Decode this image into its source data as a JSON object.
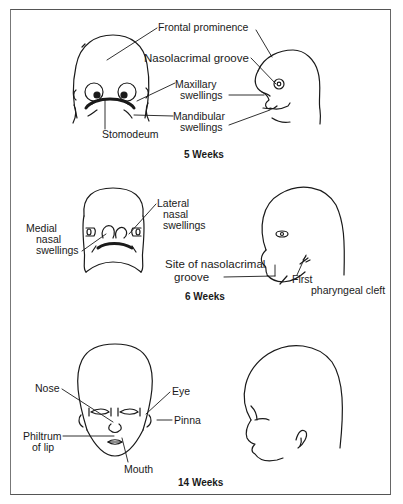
{
  "figure": {
    "panels": [
      {
        "caption": "5 Weeks",
        "labels": {
          "frontal_prominence": "Frontal prominence",
          "nasolacrimal_groove": "Nasolacrimal groove",
          "maxillary_1": "Maxillary",
          "maxillary_2": "swellings",
          "mandibular_1": "Mandibular",
          "mandibular_2": "swellings",
          "stomodeum": "Stomodeum"
        }
      },
      {
        "caption": "6 Weeks",
        "labels": {
          "lateral_1": "Lateral",
          "lateral_2": "nasal",
          "lateral_3": "swellings",
          "medial_1": "Medial",
          "medial_2": "nasal",
          "medial_3": "swellings",
          "site_1": "Site of nasolacrimal",
          "site_2": "groove",
          "cleft_1": "First",
          "cleft_2": "pharyngeal cleft"
        }
      },
      {
        "caption": "14 Weeks",
        "labels": {
          "nose": "Nose",
          "eye": "Eye",
          "pinna": "Pinna",
          "philtrum_1": "Philtrum",
          "philtrum_2": "of lip",
          "mouth": "Mouth"
        }
      }
    ]
  }
}
